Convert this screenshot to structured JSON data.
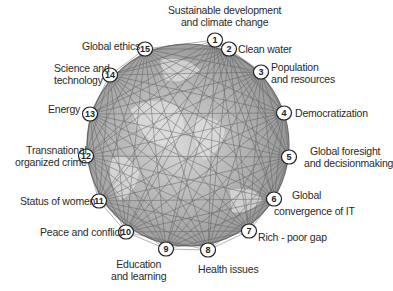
{
  "diagram": {
    "type": "network-globe",
    "globe": {
      "cx": 188,
      "cy": 145,
      "r": 101,
      "fill": "#a9a9a9",
      "edge": "#6e6e6e"
    },
    "nodes": [
      {
        "id": 1,
        "num": "1",
        "label_lines": [
          "Sustainable development",
          "and climate change"
        ],
        "x": 215,
        "y": 40
      },
      {
        "id": 2,
        "num": "2",
        "label_lines": [
          "Clean water"
        ],
        "x": 229,
        "y": 49
      },
      {
        "id": 3,
        "num": "3",
        "label_lines": [
          "Population",
          "and resources"
        ],
        "x": 261,
        "y": 72
      },
      {
        "id": 4,
        "num": "4",
        "label_lines": [
          "Democratization"
        ],
        "x": 284,
        "y": 113
      },
      {
        "id": 5,
        "num": "5",
        "label_lines": [
          "Global foresight",
          "and decisionmaking"
        ],
        "x": 289,
        "y": 157
      },
      {
        "id": 6,
        "num": "6",
        "label_lines": [
          "Global",
          "convergence of IT"
        ],
        "x": 274,
        "y": 199
      },
      {
        "id": 7,
        "num": "7",
        "label_lines": [
          "Rich - poor gap"
        ],
        "x": 249,
        "y": 231
      },
      {
        "id": 8,
        "num": "8",
        "label_lines": [
          "Health issues"
        ],
        "x": 208,
        "y": 250
      },
      {
        "id": 9,
        "num": "9",
        "label_lines": [
          "Education",
          "and learning"
        ],
        "x": 166,
        "y": 249
      },
      {
        "id": 10,
        "num": "10",
        "label_lines": [
          "Peace and conflict"
        ],
        "x": 126,
        "y": 232
      },
      {
        "id": 11,
        "num": "11",
        "label_lines": [
          "Status of women"
        ],
        "x": 99,
        "y": 201
      },
      {
        "id": 12,
        "num": "12",
        "label_lines": [
          "Transnational",
          "organized crime"
        ],
        "x": 86,
        "y": 156
      },
      {
        "id": 13,
        "num": "13",
        "label_lines": [
          "Energy"
        ],
        "x": 90,
        "y": 114
      },
      {
        "id": 14,
        "num": "14",
        "label_lines": [
          "Science and",
          "technology"
        ],
        "x": 110,
        "y": 75
      },
      {
        "id": 15,
        "num": "15",
        "label_lines": [
          "Global ethics"
        ],
        "x": 145,
        "y": 49
      }
    ],
    "labels": {
      "n1_l1": "Sustainable development",
      "n1_l2": "and climate change",
      "n2": "Clean water",
      "n3_l1": "Population",
      "n3_l2": "and resources",
      "n4": "Democratization",
      "n5_l1": "Global foresight",
      "n5_l2": "and decisionmaking",
      "n6_l1": "Global",
      "n6_l2": "convergence of IT",
      "n7": "Rich - poor gap",
      "n8": "Health issues",
      "n9_l1": "Education",
      "n9_l2": "and learning",
      "n10": "Peace and conflict",
      "n11": "Status of women",
      "n12_l1": "Transnational",
      "n12_l2": "organized crime",
      "n13": "Energy",
      "n14_l1": "Science and",
      "n14_l2": "technology",
      "n15": "Global ethics"
    },
    "edge_style": {
      "color": "#555555",
      "note": "every node connected to every other node (complete graph)"
    }
  }
}
